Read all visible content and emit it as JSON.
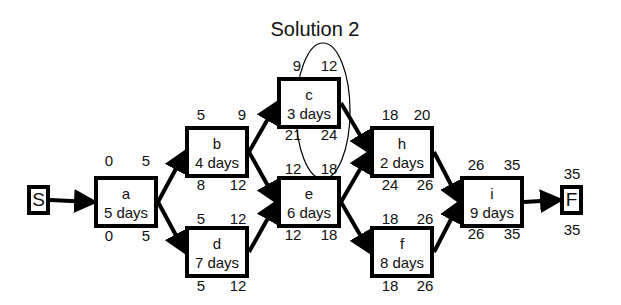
{
  "title": "Solution 2",
  "terminals": {
    "start": {
      "label": "S"
    },
    "finish": {
      "label": "F",
      "top": "35",
      "bottom": "35"
    }
  },
  "tasks": {
    "a": {
      "name": "a",
      "duration": "5 days",
      "es": "0",
      "ef": "5",
      "ls": "0",
      "lf": "5"
    },
    "b": {
      "name": "b",
      "duration": "4 days",
      "es": "5",
      "ef": "9",
      "ls": "8",
      "lf": "12"
    },
    "c": {
      "name": "c",
      "duration": "3 days",
      "es": "9",
      "ef": "12",
      "ls": "21",
      "lf": "24"
    },
    "d": {
      "name": "d",
      "duration": "7 days",
      "es": "5",
      "ef": "12",
      "ls": "5",
      "lf": "12"
    },
    "e": {
      "name": "e",
      "duration": "6 days",
      "es": "12",
      "ef": "18",
      "ls": "12",
      "lf": "18"
    },
    "f": {
      "name": "f",
      "duration": "8 days",
      "es": "18",
      "ef": "26",
      "ls": "18",
      "lf": "26"
    },
    "h": {
      "name": "h",
      "duration": "2 days",
      "es": "18",
      "ef": "20",
      "ls": "24",
      "lf": "26"
    },
    "i": {
      "name": "i",
      "duration": "9 days",
      "es": "26",
      "ef": "35",
      "ls": "26",
      "lf": "35"
    }
  },
  "edges": [
    [
      "S",
      "a"
    ],
    [
      "a",
      "b"
    ],
    [
      "a",
      "d"
    ],
    [
      "b",
      "c"
    ],
    [
      "b",
      "e"
    ],
    [
      "d",
      "e"
    ],
    [
      "c",
      "h"
    ],
    [
      "e",
      "h"
    ],
    [
      "e",
      "f"
    ],
    [
      "h",
      "i"
    ],
    [
      "f",
      "i"
    ],
    [
      "i",
      "F"
    ]
  ],
  "highlight": {
    "target": "c",
    "marks": [
      "ef",
      "lf"
    ],
    "shape": "ellipse"
  }
}
